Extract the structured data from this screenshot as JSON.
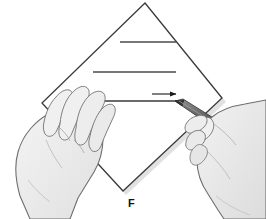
{
  "figure": {
    "caption_label": "F",
    "caption_x": 134,
    "caption_y": 199,
    "alt_description": "Two hands creasing a diamond-oriented sheet of paper with a pen",
    "background_color": "#ffffff"
  },
  "paper": {
    "name": "folded-paper-sheet",
    "shape": "diamond",
    "fill_color": "#ffffff",
    "outline_color": "#3a3a3a",
    "shadow_color": "#b8b8b8",
    "vertices": {
      "top": [
        145,
        3
      ],
      "right": [
        222,
        98
      ],
      "bottom": [
        123,
        191
      ],
      "left": [
        42,
        103
      ]
    }
  },
  "crease_lines": [
    {
      "name": "crease-line-top",
      "x1": 120,
      "y1": 42,
      "x2": 176,
      "y2": 42,
      "color": "#4a4a4a"
    },
    {
      "name": "crease-line-middle",
      "x1": 93,
      "y1": 72,
      "x2": 176,
      "y2": 72,
      "color": "#4a4a4a"
    },
    {
      "name": "crease-line-active",
      "x1": 64,
      "y1": 101,
      "x2": 178,
      "y2": 101,
      "color": "#3a3a3a"
    }
  ],
  "direction_arrow": {
    "name": "direction-arrow",
    "x1": 152,
    "y1": 94,
    "x2": 177,
    "y2": 94,
    "color": "#1a1a1a",
    "direction": "right"
  },
  "pen": {
    "name": "pen",
    "tip": [
      175,
      101
    ],
    "tail": [
      239,
      140
    ],
    "body_color": "#5a5a5a",
    "tip_color": "#3c3c3c",
    "highlight_color": "#8a8a8a"
  },
  "hands": [
    {
      "name": "left-hand",
      "side": "left",
      "fill_color": "#ededed",
      "outline_color": "#6e6e6e",
      "role": "holding-paper"
    },
    {
      "name": "right-hand",
      "side": "right",
      "fill_color": "#e8e8e8",
      "outline_color": "#6e6e6e",
      "role": "holding-pen"
    }
  ]
}
